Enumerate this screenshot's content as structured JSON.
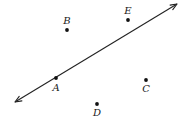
{
  "diagram": {
    "type": "geometry-points-and-line",
    "line": {
      "start": [
        15,
        102
      ],
      "end": [
        177,
        4
      ],
      "arrows": "both",
      "passes_through": "A"
    },
    "points": [
      {
        "label": "A",
        "x": 56,
        "y": 78,
        "label_x": 56,
        "label_y": 91,
        "on_line": true
      },
      {
        "label": "B",
        "x": 67,
        "y": 30,
        "label_x": 67,
        "label_y": 24,
        "on_line": false
      },
      {
        "label": "C",
        "x": 146,
        "y": 80,
        "label_x": 146,
        "label_y": 92,
        "on_line": false
      },
      {
        "label": "D",
        "x": 97,
        "y": 104,
        "label_x": 97,
        "label_y": 116,
        "on_line": false
      },
      {
        "label": "E",
        "x": 128,
        "y": 20,
        "label_x": 128,
        "label_y": 14,
        "on_line": false
      }
    ],
    "colors": {
      "background": "#ffffff",
      "stroke": "#222222",
      "text": "#1a1a1a"
    }
  }
}
